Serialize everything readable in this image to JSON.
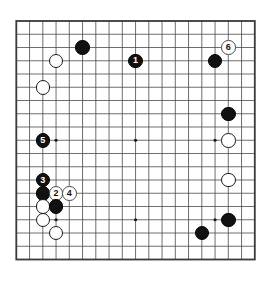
{
  "diagram": {
    "kind": "go-board-diagram",
    "board_size": 19,
    "background_color": "#ffffff",
    "line_color": "#4a4a4a",
    "border_color": "#3a3a3a",
    "black_stone_color": "#111111",
    "white_stone_color": "#ffffff",
    "geometry": {
      "origin_x": 16.3,
      "origin_y": 21.0,
      "spacing": 13.25,
      "stone_diameter": 14.5,
      "border_width": 1.8,
      "star_point_radius": 1.6
    },
    "star_points": [
      {
        "col": 3,
        "row": 3
      },
      {
        "col": 9,
        "row": 3
      },
      {
        "col": 15,
        "row": 3
      },
      {
        "col": 3,
        "row": 9
      },
      {
        "col": 9,
        "row": 9
      },
      {
        "col": 15,
        "row": 9
      },
      {
        "col": 3,
        "row": 15
      },
      {
        "col": 9,
        "row": 15
      },
      {
        "col": 15,
        "row": 15
      }
    ],
    "stones": [
      {
        "id": "stone-black-c5-r2",
        "color": "black",
        "col": 5,
        "row": 2,
        "label": ""
      },
      {
        "id": "stone-white-c3-r3",
        "color": "white",
        "col": 3,
        "row": 3,
        "label": ""
      },
      {
        "id": "stone-move-1",
        "color": "black",
        "col": 9,
        "row": 3,
        "label": "1"
      },
      {
        "id": "stone-black-c15-r3",
        "color": "black",
        "col": 15,
        "row": 3,
        "label": ""
      },
      {
        "id": "stone-move-6",
        "color": "marker",
        "col": 16,
        "row": 2,
        "label": "6"
      },
      {
        "id": "stone-white-c2-r5",
        "color": "white",
        "col": 2,
        "row": 5,
        "label": ""
      },
      {
        "id": "stone-black-c16-r7",
        "color": "black",
        "col": 16,
        "row": 7,
        "label": ""
      },
      {
        "id": "stone-move-5",
        "color": "black",
        "col": 2,
        "row": 9,
        "label": "5"
      },
      {
        "id": "stone-white-c16-r9",
        "color": "white",
        "col": 16,
        "row": 9,
        "label": ""
      },
      {
        "id": "stone-move-3",
        "color": "black",
        "col": 2,
        "row": 12,
        "label": "3"
      },
      {
        "id": "stone-white-c16-r12",
        "color": "white",
        "col": 16,
        "row": 12,
        "label": ""
      },
      {
        "id": "stone-black-c2-r13",
        "color": "black",
        "col": 2,
        "row": 13,
        "label": ""
      },
      {
        "id": "stone-move-2",
        "color": "marker",
        "col": 3,
        "row": 13,
        "label": "2"
      },
      {
        "id": "stone-move-4",
        "color": "marker",
        "col": 4,
        "row": 13,
        "label": "4"
      },
      {
        "id": "stone-white-c2-r14",
        "color": "white",
        "col": 2,
        "row": 14,
        "label": ""
      },
      {
        "id": "stone-black-c3-r14",
        "color": "black",
        "col": 3,
        "row": 14,
        "label": ""
      },
      {
        "id": "stone-white-c2-r15",
        "color": "white",
        "col": 2,
        "row": 15,
        "label": ""
      },
      {
        "id": "stone-black-c16-r15",
        "color": "black",
        "col": 16,
        "row": 15,
        "label": ""
      },
      {
        "id": "stone-white-c3-r16",
        "color": "white",
        "col": 3,
        "row": 16,
        "label": ""
      },
      {
        "id": "stone-black-c14-r16",
        "color": "black",
        "col": 14,
        "row": 16,
        "label": ""
      }
    ],
    "move_numbers": [
      "1",
      "2",
      "3",
      "4",
      "5",
      "6"
    ]
  }
}
